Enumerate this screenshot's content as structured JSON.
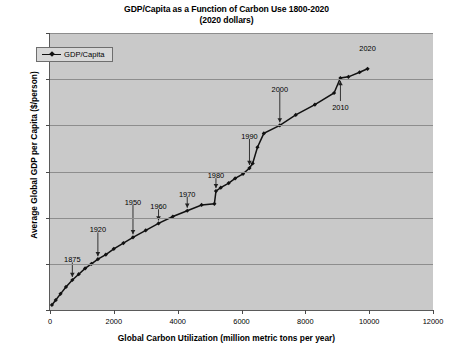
{
  "chart_data": {
    "type": "line",
    "title": "GDP/Capita as a Function of Carbon Use 1800-2020",
    "subtitle": "(2020 dollars)",
    "xlabel": "Global Carbon Utilization (million metric tons per year)",
    "ylabel": "Average Global GDP per Capita ($/person)",
    "xlim": [
      0,
      12000
    ],
    "ylim": [
      0,
      12000
    ],
    "xticks": [
      0,
      2000,
      4000,
      6000,
      8000,
      10000,
      12000
    ],
    "yticks": [
      0,
      2000,
      4000,
      6000,
      8000,
      10000,
      12000
    ],
    "grid": true,
    "legend_position": "upper-left-inside",
    "series": [
      {
        "name": "GDP/Capita",
        "color": "#111111",
        "marker": "diamond",
        "x": [
          60,
          180,
          330,
          500,
          700,
          900,
          1100,
          1300,
          1500,
          1750,
          2000,
          2300,
          2600,
          3000,
          3400,
          3850,
          4300,
          4750,
          5150,
          5200,
          5350,
          5600,
          5800,
          6050,
          6250,
          6350,
          6500,
          6700,
          7200,
          7700,
          8300,
          8900,
          9100,
          9350,
          9700,
          9950
        ],
        "y": [
          220,
          430,
          700,
          1000,
          1300,
          1550,
          1800,
          2000,
          2200,
          2400,
          2650,
          2900,
          3150,
          3450,
          3750,
          4050,
          4300,
          4550,
          4600,
          5150,
          5300,
          5500,
          5700,
          5900,
          6150,
          6350,
          7050,
          7650,
          8000,
          8450,
          8900,
          9400,
          10050,
          10100,
          10300,
          10450
        ]
      }
    ],
    "annotations": [
      {
        "label": "1875",
        "x": 700,
        "y": 1300,
        "label_y_value": 2150,
        "arrow": "down"
      },
      {
        "label": "1920",
        "x": 1500,
        "y": 2200,
        "label_y_value": 3450,
        "arrow": "down"
      },
      {
        "label": "1950",
        "x": 2600,
        "y": 3150,
        "label_y_value": 4650,
        "arrow": "down"
      },
      {
        "label": "1960",
        "x": 3400,
        "y": 3750,
        "label_y_value": 4450,
        "arrow": "down"
      },
      {
        "label": "1970",
        "x": 4300,
        "y": 4300,
        "label_y_value": 5000,
        "arrow": "down"
      },
      {
        "label": "1980",
        "x": 5200,
        "y": 5150,
        "label_y_value": 5800,
        "arrow": "down"
      },
      {
        "label": "1990",
        "x": 6250,
        "y": 6150,
        "label_y_value": 7500,
        "arrow": "down"
      },
      {
        "label": "2000",
        "x": 7200,
        "y": 8000,
        "label_y_value": 9550,
        "arrow": "down"
      },
      {
        "label": "2010",
        "x": 9100,
        "y": 10050,
        "label_y_value": 8750,
        "arrow": "up"
      },
      {
        "label": "2020",
        "x": 9950,
        "y": 10450,
        "label_y_value": 11300,
        "arrow": "none"
      }
    ]
  },
  "colors": {
    "plot_background": "#c9c9c9",
    "page_background": "#ffffff",
    "grid": "#8d8d8d",
    "axis": "#5a5a5a",
    "series": "#111111",
    "legend_background": "#d8d8d8"
  }
}
